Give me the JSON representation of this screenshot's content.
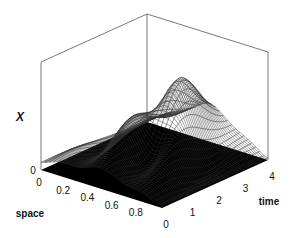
{
  "chart_data": {
    "type": "surface3d",
    "title": "",
    "xlabel": "space",
    "ylabel": "time",
    "zlabel": "X",
    "x_ticks": [
      "0",
      "0.2",
      "0.4",
      "0.6",
      "0.8"
    ],
    "y_ticks": [
      "0",
      "1",
      "2",
      "3",
      "4"
    ],
    "z_ticks": [
      "0"
    ],
    "xlim": [
      0,
      1
    ],
    "ylim": [
      0,
      4
    ],
    "surface_model": {
      "peak_time": 2.6,
      "peak_space": 0.52,
      "oscillation_count": 5
    }
  }
}
